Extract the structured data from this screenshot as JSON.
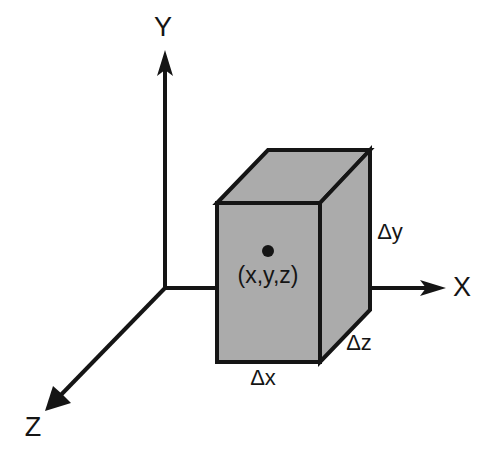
{
  "figure": {
    "background_color": "#ffffff",
    "line_color": "#151515",
    "fill_color": "#ababab"
  },
  "axes": [
    {
      "name": "y-axis",
      "label": "Y",
      "direction": "up",
      "label_x": 163,
      "label_y": 28
    },
    {
      "name": "x-axis",
      "label": "X",
      "direction": "right",
      "label_x": 462,
      "label_y": 288
    },
    {
      "name": "z-axis",
      "label": "Z",
      "direction": "down-left",
      "label_x": 33,
      "label_y": 428
    }
  ],
  "origin": {
    "x": 165,
    "y": 288
  },
  "box": {
    "name": "control-volume",
    "front_face": "217,203 320,203 320,362 217,362",
    "top_face": "217,203 268,150 370,150 320,203",
    "right_face": "320,203 370,150 370,310 320,362",
    "fill": "#ababab",
    "stroke": "#151515"
  },
  "point": {
    "label": "(x,y,z)",
    "dot_x": 268,
    "dot_y": 251,
    "dot_r": 6,
    "label_x": 268,
    "label_y": 276
  },
  "dimensions": [
    {
      "name": "delta-x-label",
      "label": "Δx",
      "x": 263,
      "y": 378
    },
    {
      "name": "delta-y-label",
      "label": "Δy",
      "x": 390,
      "y": 232
    },
    {
      "name": "delta-z-label",
      "label": "Δz",
      "x": 359,
      "y": 343
    }
  ]
}
